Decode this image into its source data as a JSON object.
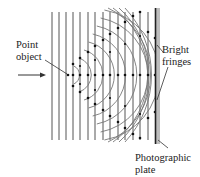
{
  "figure": {
    "labels": {
      "point_object": [
        "Point",
        "object"
      ],
      "bright_fringes": [
        "Bright",
        "fringes"
      ],
      "photographic_plate": [
        "Photographic",
        "plate"
      ]
    },
    "elements": {
      "reference_wave": "plane wavefronts (vertical lines)",
      "object_wave": "spherical wavefronts from point object",
      "fringe_markers": "dots at intersections of plane and spherical wavefronts",
      "incoming_arrow": "arrow pointing right toward wavefronts"
    },
    "colors": {
      "line": "#444444",
      "plate": "#222222",
      "plate_shade": "#bdbdbd",
      "dot": "#111111"
    }
  }
}
